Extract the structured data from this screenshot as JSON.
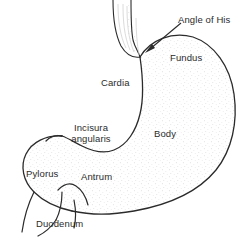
{
  "figure": {
    "style": "black-and-white stippled line drawing",
    "colors": {
      "background": "#ffffff",
      "outline": "#2b2b2b",
      "text": "#2b2b2b",
      "stipple": "#bdbdbd"
    }
  },
  "labels": {
    "angle_of_his": "Angle of His",
    "fundus": "Fundus",
    "cardia": "Cardia",
    "body": "Body",
    "incisura_line1": "Incisura",
    "incisura_line2": "angularis",
    "pylorus": "Pylorus",
    "antrum": "Antrum",
    "duodenum": "Duodenum"
  },
  "annotations": {
    "arrow": {
      "name": "angle-of-his-arrow",
      "points_to": "Angle of His notch",
      "from_x": 180,
      "from_y": 22,
      "to_x": 147,
      "to_y": 52
    }
  },
  "parts": [
    "esophagus",
    "fundus",
    "cardia",
    "body",
    "incisura angularis",
    "antrum",
    "pylorus",
    "duodenum"
  ]
}
